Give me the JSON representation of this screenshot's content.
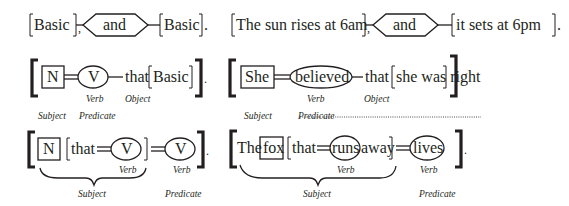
{
  "row1": {
    "left": {
      "clause1": "Basic",
      "conjunction": "and",
      "clause2": "Basic"
    },
    "right": {
      "clause1": "The sun rises at 6am",
      "conjunction": "and",
      "clause2": "it sets at 6pm"
    }
  },
  "row2": {
    "left": {
      "subject": "N",
      "verb": "V",
      "connector": "that",
      "object_clause": "Basic",
      "labels": {
        "verb": "Verb",
        "object": "Object",
        "subject": "Subject",
        "predicate": "Predicate"
      }
    },
    "right": {
      "subject": "She",
      "verb": "believed",
      "connector": "that",
      "object_clause": "she was right",
      "labels": {
        "verb": "Verb",
        "object": "Object",
        "subject": "Subject",
        "predicate": "Predicate"
      }
    }
  },
  "row3": {
    "left": {
      "subject": "N",
      "relative_word": "that",
      "rel_verb": "V",
      "main_verb": "V",
      "labels": {
        "rel_verb": "Verb",
        "main_verb": "Verb",
        "subject": "Subject",
        "predicate": "Predicate"
      }
    },
    "right": {
      "article": "The",
      "subject": "fox",
      "relative_word": "that",
      "rel_verb": "runs",
      "rel_tail": "away",
      "main_verb": "lives",
      "labels": {
        "rel_verb": "Verb",
        "main_verb": "Verb",
        "subject": "Subject",
        "predicate": "Predicate"
      }
    }
  },
  "punctuation": {
    "comma": ",",
    "period": ".",
    "lbracket": "[",
    "rbracket": "]"
  }
}
